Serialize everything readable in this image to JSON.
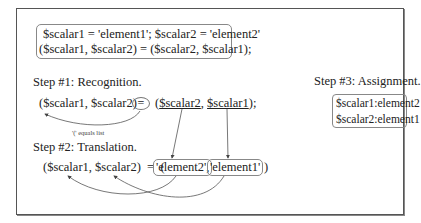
{
  "code_box": {
    "line1": "$scalar1 = 'element1'; $scalar2 = 'element2'",
    "line2": "($scalar1, $scalar2)  =  ($scalar2, $scalar1);"
  },
  "step1": {
    "title": "Step #1: Recognition.",
    "lhs": "($scalar1, $scalar2)",
    "equals": "=",
    "rhs_open": "(",
    "rhs_var1": "$scalar2",
    "rhs_sep": ", ",
    "rhs_var2": "$scalar1",
    "rhs_close": ");",
    "annotation": "'(' equals list"
  },
  "step2": {
    "title": "Step #2: Translation.",
    "lhs": "($scalar1, $scalar2)  =  (",
    "elem1": "'element2',",
    "elem2": "'element1'",
    "close": ")"
  },
  "step3": {
    "title": "Step #3: Assignment.",
    "results": [
      "$scalar1:element2",
      "$scalar2:element1"
    ]
  }
}
